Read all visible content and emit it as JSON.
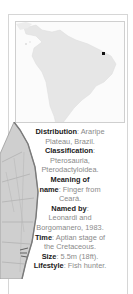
{
  "map": {
    "region": "South America",
    "marker_label": "Araripe Plateau location"
  },
  "facts": {
    "distribution_label": "Distribution",
    "distribution_value_1": ": Araripe",
    "distribution_value_2": "Plateau, Brazil.",
    "classification_label": "Classification",
    "classification_colon": ":",
    "classification_value_1": "Pterosauria,",
    "classification_value_2": "Pterodactyloidea.",
    "meaning_label_1": "Meaning of",
    "meaning_label_2": "name",
    "meaning_value_1": ": Finger from",
    "meaning_value_2": "Ceará.",
    "named_by_label": "Named by",
    "named_by_colon": ":",
    "named_by_value_1": "Leonardi and",
    "named_by_value_2": "Borgomanero, 1983.",
    "time_label": "Time",
    "time_value_1": ": Aptian stage of",
    "time_value_2": "the Cretaceous.",
    "size_label": "Size",
    "size_value": ": 5.5m (18ft).",
    "lifestyle_label": "Lifestyle",
    "lifestyle_value": ": Fish hunter."
  },
  "colors": {
    "marker": "#111111",
    "land": "#e4e4e4",
    "label_text": "#1a1a1a",
    "value_text": "#8a8a8a"
  }
}
